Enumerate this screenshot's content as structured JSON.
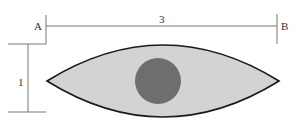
{
  "diagram": {
    "labels": {
      "point_a": "A",
      "point_b": "B",
      "length": "3",
      "height": "1"
    },
    "shapes": {
      "lens": {
        "fill": "#d3d3d3",
        "stroke": "#1a1a1a"
      },
      "circle": {
        "fill": "#6e6e6e"
      }
    },
    "colors": {
      "dimension_line": "#666666",
      "text": "#333333"
    }
  }
}
